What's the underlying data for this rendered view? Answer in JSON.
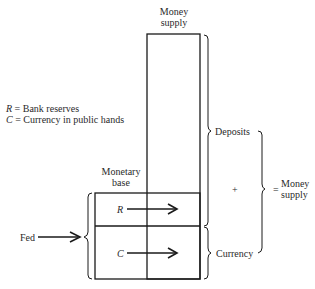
{
  "diagram": {
    "top_label": {
      "line1": "Money",
      "line2": "supply"
    },
    "legend": {
      "r_symbol": "R",
      "r_text": " = Bank reserves",
      "c_symbol": "C",
      "c_text": " = Currency in public hands"
    },
    "monetary_base_label": {
      "line1": "Monetary",
      "line2": "base"
    },
    "box_labels": {
      "reserves": "R",
      "currency": "C"
    },
    "source_label": "Fed",
    "right_labels": {
      "deposits": "Deposits",
      "currency": "Currency",
      "plus": "+",
      "equals": "=",
      "result_line1": "Money",
      "result_line2": "supply"
    },
    "colors": {
      "line": "#1a1a1a",
      "background": "#ffffff"
    }
  }
}
